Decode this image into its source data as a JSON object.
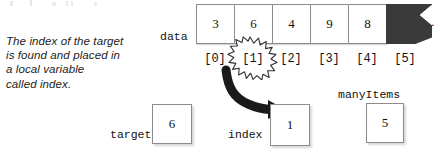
{
  "figure": {
    "type": "array-diagram",
    "caption_lines": [
      "The index of the target",
      "is found and placed in",
      "a local variable",
      "called index."
    ]
  },
  "array": {
    "label": "data",
    "cells": [
      {
        "index_label": "[0]",
        "value": "3",
        "filled": false
      },
      {
        "index_label": "[1]",
        "value": "6",
        "filled": false
      },
      {
        "index_label": "[2]",
        "value": "4",
        "filled": false
      },
      {
        "index_label": "[3]",
        "value": "9",
        "filled": false
      },
      {
        "index_label": "[4]",
        "value": "8",
        "filled": false
      },
      {
        "index_label": "[5]",
        "value": "",
        "filled": true
      }
    ],
    "ellipsis": "...",
    "highlighted_index_label": "[1]",
    "fill_color": "#3a3a3a",
    "border_color": "#8c8c8c"
  },
  "variables": [
    {
      "name": "target",
      "value": "6",
      "label_position": "left"
    },
    {
      "name": "index",
      "value": "1",
      "label_position": "left"
    },
    {
      "name": "manyItems",
      "value": "5",
      "label_position": "top"
    }
  ],
  "annotations": {
    "arrow_from": "[1]",
    "arrow_to": "index",
    "arrow_color": "#1a1a1a",
    "burst_stroke": "#2a2a2a"
  }
}
